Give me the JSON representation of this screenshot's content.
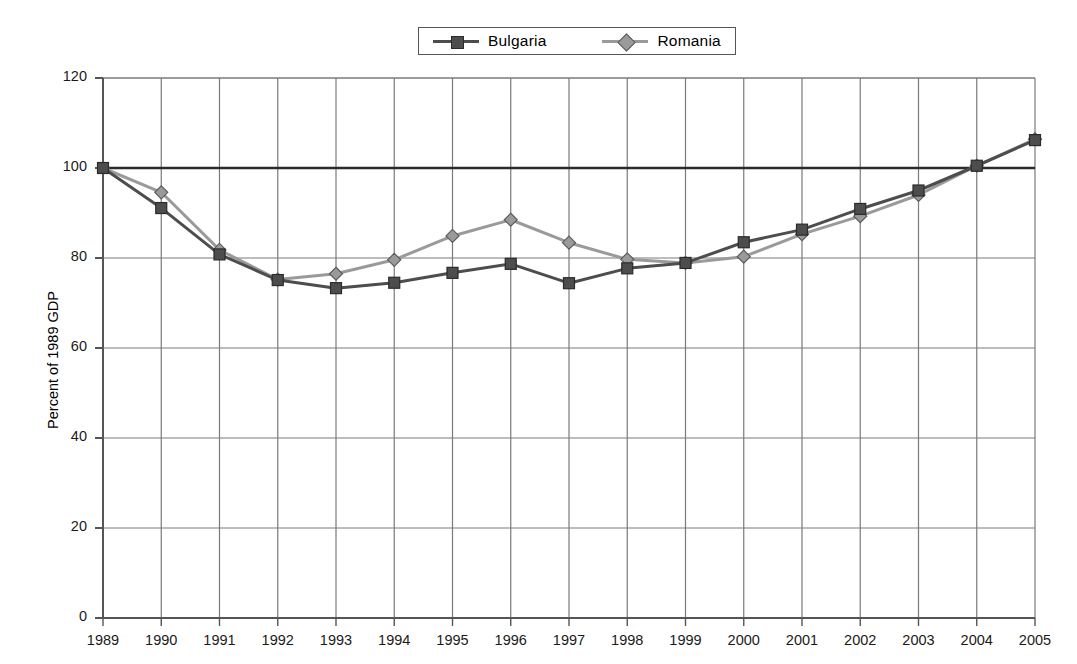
{
  "chart_data": {
    "type": "line",
    "title": "",
    "xlabel": "",
    "ylabel": "Percent of 1989 GDP",
    "categories": [
      "1989",
      "1990",
      "1991",
      "1992",
      "1993",
      "1994",
      "1995",
      "1996",
      "1997",
      "1998",
      "1999",
      "2000",
      "2001",
      "2002",
      "2003",
      "2004",
      "2005"
    ],
    "xlim": [
      1989,
      2005
    ],
    "ylim": [
      0,
      120
    ],
    "yticks": [
      0,
      20,
      40,
      60,
      80,
      100,
      120
    ],
    "grid": "both",
    "reference_line": 100,
    "legend_position": "top-center",
    "series": [
      {
        "name": "Bulgaria",
        "marker": "square",
        "color": "#4d4d4d",
        "values": [
          100,
          91.1,
          80.8,
          75.1,
          73.3,
          74.5,
          76.7,
          78.7,
          74.4,
          77.7,
          78.9,
          83.5,
          86.3,
          90.9,
          95.0,
          100.5,
          106.2
        ]
      },
      {
        "name": "Romania",
        "marker": "diamond",
        "color": "#9a9a9a",
        "values": [
          100,
          94.6,
          81.8,
          75.2,
          76.5,
          79.6,
          84.9,
          88.5,
          83.4,
          79.7,
          78.9,
          80.3,
          85.3,
          89.3,
          94.0,
          100.5,
          106.4
        ]
      }
    ]
  },
  "legend": {
    "items": [
      {
        "label": "Bulgaria",
        "color": "#4d4d4d",
        "marker": "square"
      },
      {
        "label": "Romania",
        "color": "#9a9a9a",
        "marker": "diamond"
      }
    ]
  },
  "axes": {
    "y_title": "Percent of 1989 GDP",
    "y_labels": [
      "120",
      "100",
      "80",
      "60",
      "40",
      "20",
      "0"
    ],
    "x_labels": [
      "1989",
      "1990",
      "1991",
      "1992",
      "1993",
      "1994",
      "1995",
      "1996",
      "1997",
      "1998",
      "1999",
      "2000",
      "2001",
      "2002",
      "2003",
      "2004",
      "2005"
    ]
  },
  "colors": {
    "bulgaria": "#4d4d4d",
    "romania": "#9a9a9a",
    "grid": "#7a7a7a",
    "axis": "#555555",
    "reference": "#2b2b2b"
  }
}
